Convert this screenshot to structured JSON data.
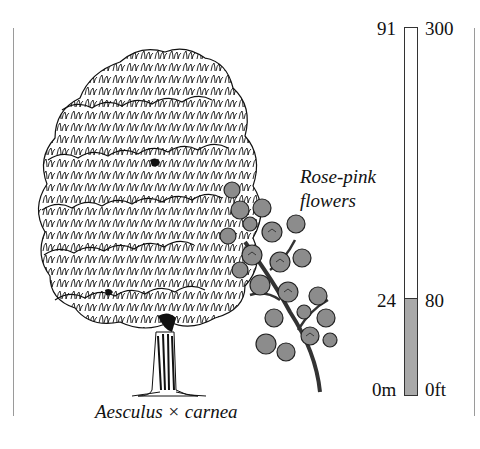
{
  "species": {
    "name": "Aesculus × carnea",
    "flower_note_line1": "Rose-pink",
    "flower_note_line2": "flowers"
  },
  "scale": {
    "metric": {
      "top": "91",
      "mark": "24",
      "bottom": "0m"
    },
    "imperial": {
      "top": "300",
      "mark": "80",
      "bottom": "0ft"
    },
    "max_height_m": 91,
    "tree_height_m": 24,
    "max_height_ft": 300,
    "tree_height_ft": 80,
    "fill_color": "#a9a9a9"
  },
  "illustration": {
    "tree": "deciduous-tree-line-drawing",
    "branch": "flower-panicle-drawing",
    "flower_color": "#8c8c8c"
  }
}
